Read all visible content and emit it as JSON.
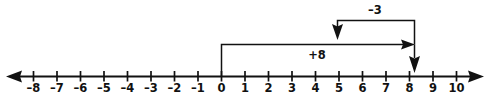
{
  "chart_data": {
    "type": "line",
    "title": "",
    "subtitle": "",
    "xlabel": "",
    "ylabel": "",
    "grid": false,
    "legend": null,
    "axis": {
      "min": -8,
      "max": 10,
      "step": 1,
      "left_arrow": true,
      "right_arrow": true,
      "tick_labels": [
        "–8",
        "–7",
        "–6",
        "–5",
        "–4",
        "–3",
        "–2",
        "–1",
        "0",
        "1",
        "2",
        "3",
        "4",
        "5",
        "6",
        "7",
        "8",
        "9",
        "10"
      ],
      "tick_values": [
        -8,
        -7,
        -6,
        -5,
        -4,
        -3,
        -2,
        -1,
        0,
        1,
        2,
        3,
        4,
        5,
        6,
        7,
        8,
        9,
        10
      ]
    },
    "jumps": [
      {
        "label": "+8",
        "value": 8,
        "start": 0,
        "end": 8,
        "direction": "right",
        "label_position": "below",
        "level": 1
      },
      {
        "label": "–3",
        "value": -3,
        "start": 8,
        "end": 5,
        "direction": "left",
        "label_position": "above",
        "level": 2
      }
    ],
    "result": {
      "value": 8,
      "marker": "down-arrow"
    },
    "colors": {
      "ink": "#111111",
      "background": "#ffffff"
    }
  }
}
